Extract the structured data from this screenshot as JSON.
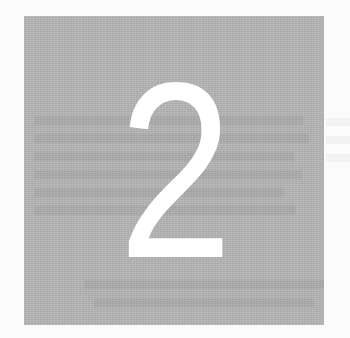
{
  "page": {
    "background_color": "#ffffff"
  },
  "chapter_marker": {
    "number": "2",
    "block_color": "#b5b5b5",
    "number_color": "#ffffff"
  }
}
